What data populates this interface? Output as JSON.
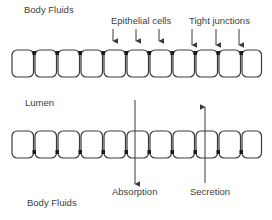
{
  "diagram": {
    "labels": {
      "top_body_fluids": "Body Fluids",
      "epithelial_cells": "Epithelial cells",
      "tight_junctions": "Tight junctions",
      "lumen": "Lumen",
      "absorption": "Absorption",
      "secretion": "Secretion",
      "bottom_body_fluids": "Body Fluids"
    },
    "top_layer": {
      "cell_count": 11,
      "junction_position": "top"
    },
    "bottom_layer": {
      "cell_count": 11,
      "junction_position": "bottom"
    },
    "arrows": [
      {
        "label": "Absorption",
        "direction": "down"
      },
      {
        "label": "Secretion",
        "direction": "up"
      }
    ],
    "colors": {
      "stroke": "#3a3a3a",
      "junction": "#1a1a1a",
      "background": "#ffffff"
    }
  }
}
